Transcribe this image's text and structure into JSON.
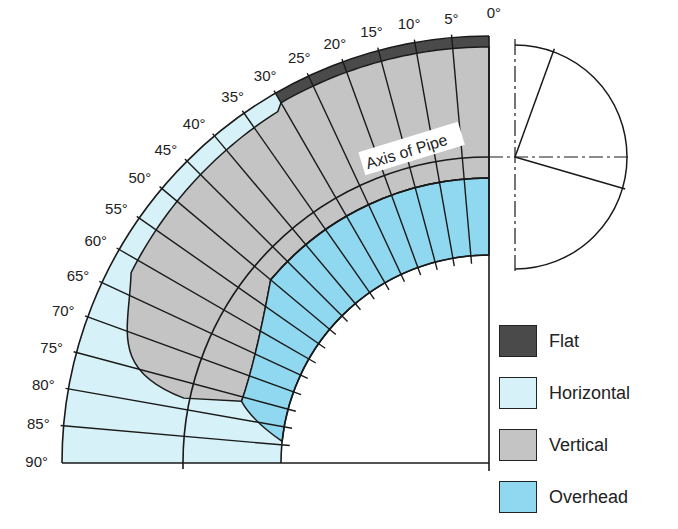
{
  "diagram": {
    "axis_label": "Axis of Pipe",
    "angle_labels": [
      "0°",
      "5°",
      "10°",
      "15°",
      "20°",
      "25°",
      "30°",
      "35°",
      "40°",
      "45°",
      "50°",
      "55°",
      "60°",
      "65°",
      "70°",
      "75°",
      "80°",
      "85°",
      "90°"
    ],
    "colors": {
      "flat": "#4a4a4a",
      "horizontal": "#d6f2f8",
      "vertical": "#c4c4c4",
      "overhead": "#8fd8ef",
      "line": "#1a1a1a"
    }
  },
  "legend": {
    "items": [
      {
        "label": "Flat",
        "color": "#4a4a4a"
      },
      {
        "label": "Horizontal",
        "color": "#d6f2f8"
      },
      {
        "label": "Vertical",
        "color": "#c4c4c4"
      },
      {
        "label": "Overhead",
        "color": "#8fd8ef"
      }
    ]
  }
}
